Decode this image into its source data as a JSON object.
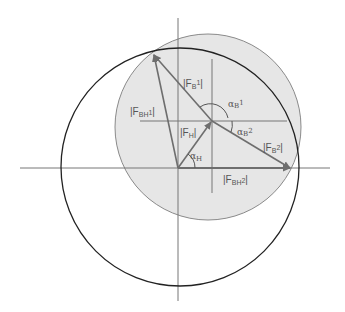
{
  "diagram": {
    "type": "vector-force-diagram",
    "colors": {
      "background": "#ffffff",
      "axis": "#777777",
      "black_circle": "#222222",
      "gray_circle_fill": "#e6e6e6",
      "gray_circle_stroke": "#8a8a8a",
      "vector": "#6e6e6e",
      "label": "#555555"
    },
    "labels": {
      "F_B1": {
        "pre": "|F",
        "sub": "B",
        "sup": "1",
        "post": "|"
      },
      "F_BH1": {
        "pre": "|F",
        "sub": "BH",
        "sup": "1",
        "post": "|"
      },
      "F_H": {
        "pre": "|F",
        "sub": "H",
        "post": "|"
      },
      "F_B2": {
        "pre": "|F",
        "sub": "B",
        "sup": "2",
        "post": "|"
      },
      "F_BH2": {
        "pre": "|F",
        "sub": "BH",
        "sup": "2",
        "post": "|"
      },
      "alpha_B1": {
        "greek": "α",
        "sub": "B",
        "sup": "1"
      },
      "alpha_B2": {
        "greek": "α",
        "sub": "B",
        "sup": "2"
      },
      "alpha_H": {
        "greek": "α",
        "sub": "H"
      }
    }
  }
}
